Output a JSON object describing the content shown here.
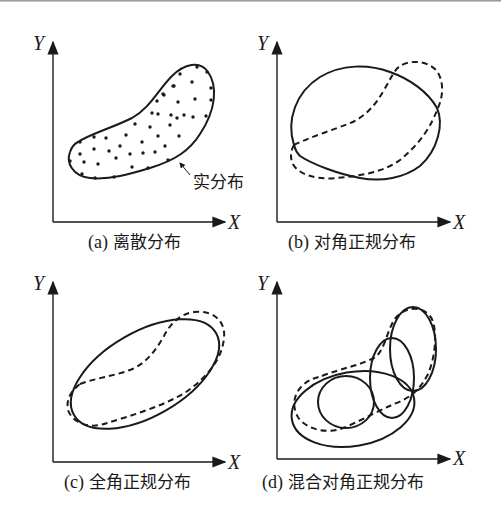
{
  "figure": {
    "panels": [
      {
        "id": "a",
        "tag": "(a)",
        "caption": "离散分布",
        "x_axis": "X",
        "y_axis": "Y",
        "annotation": "实分布"
      },
      {
        "id": "b",
        "tag": "(b)",
        "caption": "对角正规分布",
        "x_axis": "X",
        "y_axis": "Y"
      },
      {
        "id": "c",
        "tag": "(c)",
        "caption": "全角正规分布",
        "x_axis": "X",
        "y_axis": "Y"
      },
      {
        "id": "d",
        "tag": "(d)",
        "caption": "混合对角正规分布",
        "x_axis": "X",
        "y_axis": "Y"
      }
    ],
    "legend_semantics": {
      "solid_line": "model distribution",
      "dashed_line": "real distribution"
    },
    "colors": {
      "ink": "#1a1a1a",
      "background": "#ffffff"
    }
  }
}
